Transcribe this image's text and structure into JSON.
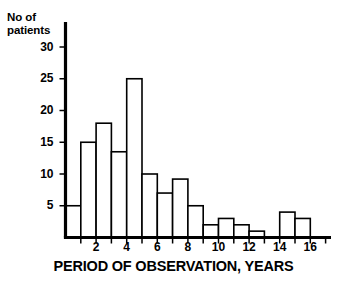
{
  "chart_data": {
    "type": "bar",
    "title": "",
    "xlabel": "PERIOD OF OBSERVATION, YEARS",
    "ylabel": "No of\npatients",
    "ylabel_lines": [
      "No of",
      "patients"
    ],
    "bin_width": 1,
    "bin_starts": [
      0,
      1,
      2,
      3,
      4,
      5,
      6,
      7,
      8,
      9,
      10,
      11,
      12,
      13,
      14,
      15
    ],
    "categories": [
      "0-1",
      "1-2",
      "2-3",
      "3-4",
      "4-5",
      "5-6",
      "6-7",
      "7-8",
      "8-9",
      "9-10",
      "10-11",
      "11-12",
      "12-13",
      "13-14",
      "14-15",
      "15-16"
    ],
    "values": [
      5,
      15,
      18,
      13.5,
      25,
      10,
      7,
      9.2,
      5,
      2,
      3,
      2,
      1,
      0,
      4,
      3
    ],
    "xlim": [
      0,
      17.5
    ],
    "ylim": [
      0,
      33
    ],
    "y_ticks": [
      5,
      10,
      15,
      20,
      25,
      30
    ],
    "y_tick_labels": [
      "5",
      "10",
      "15",
      "20",
      "25",
      "30"
    ],
    "x_ticks": [
      1,
      2,
      3,
      4,
      5,
      6,
      7,
      8,
      9,
      10,
      11,
      12,
      13,
      14,
      15,
      16,
      17
    ],
    "x_tick_labels_shown": [
      "2",
      "4",
      "6",
      "8",
      "10",
      "12",
      "14",
      "16"
    ],
    "x_tick_labels_values": [
      2,
      4,
      6,
      8,
      10,
      12,
      14,
      16
    ],
    "grid": false,
    "legend": false,
    "bar_fill_color": "#ffffff",
    "bar_edge_color": "#000000",
    "axis_color": "#000000",
    "background_color": "#ffffff"
  }
}
